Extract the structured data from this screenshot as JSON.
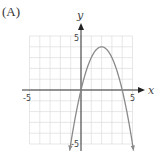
{
  "panel_label": "(A)",
  "chart_data": {
    "type": "line",
    "title": "",
    "function": "y = -x^2 + 4x",
    "xlabel": "x",
    "ylabel": "y",
    "xlim": [
      -5,
      5
    ],
    "ylim": [
      -5,
      5
    ],
    "grid": true,
    "x_ticks_labeled": [
      "-5",
      "5"
    ],
    "y_ticks_labeled": [
      "5",
      "-5"
    ],
    "vertex": [
      2,
      4
    ],
    "roots": [
      0,
      4
    ],
    "series": [
      {
        "name": "parabola",
        "x": [
          -1.1,
          -1,
          -0.5,
          0,
          0.5,
          1,
          1.5,
          2,
          2.5,
          3,
          3.5,
          4,
          4.5,
          5,
          5.1
        ],
        "y": [
          -5.61,
          -5,
          -2.25,
          0,
          1.75,
          3,
          3.75,
          4,
          3.75,
          3,
          1.75,
          0,
          -2.25,
          -5,
          -5.61
        ]
      }
    ],
    "colors": {
      "curve": "#8a8a8a",
      "axes": "#333333",
      "grid": "#dddddd"
    }
  }
}
